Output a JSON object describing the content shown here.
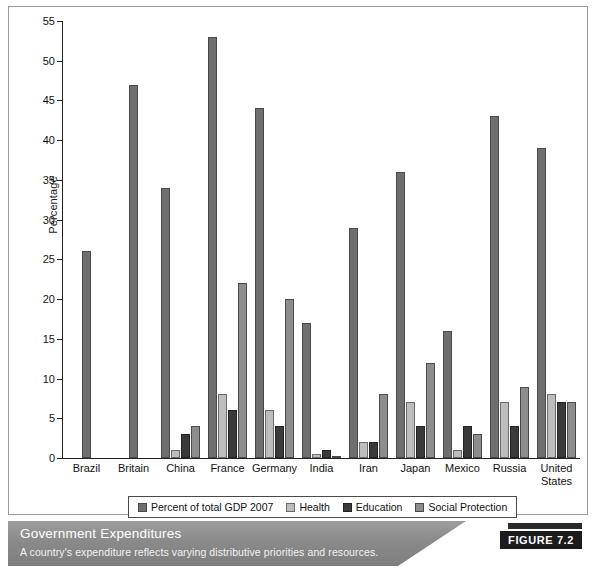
{
  "caption": {
    "title": "Government Expenditures",
    "subtitle": "A country's expenditure reflects varying distributive priorities and resources.",
    "badge": "FIGURE 7.2"
  },
  "colors": {
    "series_gdp": "#6f6f6f",
    "series_health": "#bdbdbd",
    "series_education": "#3a3a3a",
    "series_social": "#8d8d8d",
    "caption_bar": "#8a8a8a",
    "badge_bg": "#1b1b1b"
  },
  "chart_data": {
    "type": "bar",
    "title": "Government Expenditures",
    "xlabel": "",
    "ylabel": "Percentage",
    "ylim": [
      0,
      55
    ],
    "yticks": [
      0,
      5,
      10,
      15,
      20,
      25,
      30,
      35,
      40,
      45,
      50,
      55
    ],
    "ytick_labels": [
      "0",
      "5",
      "10",
      "15",
      "20",
      "25",
      "30",
      "35",
      "40",
      "45",
      "50",
      "55"
    ],
    "grid": false,
    "legend_position": "bottom",
    "categories": [
      "Brazil",
      "Britain",
      "China",
      "France",
      "Germany",
      "India",
      "Iran",
      "Japan",
      "Mexico",
      "Russia",
      "United States"
    ],
    "category_lines": [
      [
        "Brazil"
      ],
      [
        "Britain"
      ],
      [
        "China"
      ],
      [
        "France"
      ],
      [
        "Germany"
      ],
      [
        "India"
      ],
      [
        "Iran"
      ],
      [
        "Japan"
      ],
      [
        "Mexico"
      ],
      [
        "Russia"
      ],
      [
        "United",
        "States"
      ]
    ],
    "series": [
      {
        "name": "Percent of total GDP 2007",
        "color": "#6f6f6f",
        "values": [
          26,
          47,
          34,
          53,
          44,
          17,
          29,
          36,
          16,
          43,
          39
        ]
      },
      {
        "name": "Health",
        "color": "#bdbdbd",
        "values": [
          0,
          0,
          1,
          8,
          6,
          0.5,
          2,
          7,
          1,
          7,
          8
        ]
      },
      {
        "name": "Education",
        "color": "#3a3a3a",
        "values": [
          0,
          0,
          3,
          6,
          4,
          1,
          2,
          4,
          4,
          4,
          7
        ]
      },
      {
        "name": "Social Protection",
        "color": "#8d8d8d",
        "values": [
          0,
          0,
          4,
          22,
          20,
          0.3,
          8,
          12,
          3,
          9,
          7
        ]
      }
    ]
  }
}
